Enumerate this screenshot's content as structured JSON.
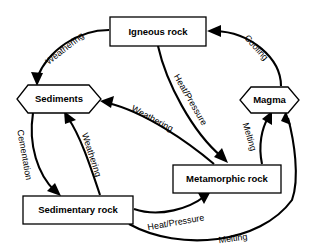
{
  "diagram": {
    "background_color": "#ffffff",
    "stroke_color": "#000000",
    "nodes": [
      {
        "id": "igneous",
        "label": "Igneous rock",
        "shape": "rectangle"
      },
      {
        "id": "sediments",
        "label": "Sediments",
        "shape": "hexagon"
      },
      {
        "id": "magma",
        "label": "Magma",
        "shape": "hexagon"
      },
      {
        "id": "metamorphic",
        "label": "Metamorphic rock",
        "shape": "rectangle"
      },
      {
        "id": "sedimentary",
        "label": "Sedimentary rock",
        "shape": "rectangle"
      }
    ],
    "edges": [
      {
        "id": "igneous-to-sediments",
        "from": "Igneous rock",
        "to": "Sediments",
        "label": "Weathering"
      },
      {
        "id": "magma-to-igneous",
        "from": "Magma",
        "to": "Igneous rock",
        "label": "Cooling"
      },
      {
        "id": "igneous-to-metamorphic",
        "from": "Igneous rock",
        "to": "Metamorphic rock",
        "label": "Heat/Pressure"
      },
      {
        "id": "metamorphic-to-sediments",
        "from": "Metamorphic rock",
        "to": "Sediments",
        "label": "Weathering"
      },
      {
        "id": "sediments-to-sedimentary",
        "from": "Sediments",
        "to": "Sedimentary rock",
        "label": "Cementation"
      },
      {
        "id": "sedimentary-to-sediments",
        "from": "Sedimentary rock",
        "to": "Sediments",
        "label": "Weathering"
      },
      {
        "id": "metamorphic-to-magma",
        "from": "Metamorphic rock",
        "to": "Magma",
        "label": "Melting"
      },
      {
        "id": "sedimentary-to-metamorphic",
        "from": "Sedimentary rock",
        "to": "Metamorphic rock",
        "label": "Heat/Pressure"
      },
      {
        "id": "sedimentary-to-magma",
        "from": "Sedimentary rock",
        "to": "Magma",
        "label": "Melting"
      }
    ]
  }
}
